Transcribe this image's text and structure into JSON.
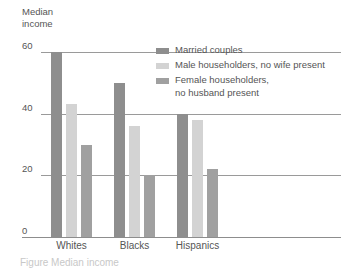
{
  "axis_title": "Median\nincome",
  "caption": "Figure  Median income",
  "chart_data": {
    "type": "bar",
    "title": "",
    "subtitle": "",
    "xlabel": "",
    "ylabel": "Median income",
    "ylim": [
      0,
      60
    ],
    "yticks": [
      0,
      20,
      40,
      60
    ],
    "ytick_labels": [
      "0",
      "20",
      "40",
      "60"
    ],
    "grid": true,
    "grid_axis": "y",
    "legend_position": "inside-top-right",
    "categories": [
      "Whites",
      "Blacks",
      "Hispanics"
    ],
    "series": [
      {
        "name": "Married couples",
        "color": "#8e8e8e",
        "values": [
          60,
          50,
          40
        ]
      },
      {
        "name": "Male householders, no wife present",
        "color": "#d3d3d3",
        "values": [
          43,
          36,
          38
        ]
      },
      {
        "name": "Female householders, no husband present",
        "color": "#a0a0a0",
        "values": [
          30,
          20,
          22
        ]
      }
    ]
  }
}
